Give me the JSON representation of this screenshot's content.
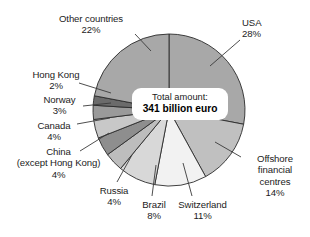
{
  "chart_data": {
    "type": "pie",
    "title": "",
    "subtitle": "",
    "xlabel": "",
    "ylabel": "",
    "legend_position": "none",
    "grid": false,
    "units": "percent",
    "total_label_top": "Total amount:",
    "total_label_bottom": "341 billion euro",
    "total_value": 341,
    "total_units": "billion euro",
    "start_angle_deg": 0,
    "direction": "clockwise",
    "categories": [
      "USA",
      "Offshore financial centres",
      "Switzerland",
      "Brazil",
      "Russia",
      "China (except Hong Kong)",
      "Canada",
      "Norway",
      "Hong Kong",
      "Other countries"
    ],
    "values": [
      28,
      14,
      11,
      8,
      4,
      4,
      4,
      3,
      2,
      22
    ],
    "slices": [
      {
        "name": "USA",
        "value": 28,
        "label": "USA",
        "pct": "28%",
        "color": "#a8a8a8"
      },
      {
        "name": "Offshore financial centres",
        "value": 14,
        "label": "Offshore financial centres",
        "pct": "14%",
        "color": "#c0c0c0"
      },
      {
        "name": "Switzerland",
        "value": 11,
        "label": "Switzerland",
        "pct": "11%",
        "color": "#f2f2f2"
      },
      {
        "name": "Brazil",
        "value": 8,
        "label": "Brazil",
        "pct": "8%",
        "color": "#d8d8d8"
      },
      {
        "name": "Russia",
        "value": 4,
        "label": "Russia",
        "pct": "4%",
        "color": "#bdbdbd"
      },
      {
        "name": "China (except Hong Kong)",
        "value": 4,
        "label": "China",
        "pct": "4%",
        "color": "#8e8e8e"
      },
      {
        "name": "Canada",
        "value": 4,
        "label": "Canada",
        "pct": "4%",
        "color": "#c8c8c8"
      },
      {
        "name": "Norway",
        "value": 3,
        "label": "Norway",
        "pct": "3%",
        "color": "#9a9a9a"
      },
      {
        "name": "Hong Kong",
        "value": 2,
        "label": "Hong Kong",
        "pct": "2%",
        "color": "#6b6b6b"
      },
      {
        "name": "Other countries",
        "value": 22,
        "label": "Other countries",
        "pct": "22%",
        "color": "#a8a8a8"
      }
    ]
  },
  "labels": {
    "other_countries": {
      "name": "Other countries",
      "pct": "22%"
    },
    "usa": {
      "name": "USA",
      "pct": "28%"
    },
    "hong_kong": {
      "name": "Hong Kong",
      "pct": "2%"
    },
    "norway": {
      "name": "Norway",
      "pct": "3%"
    },
    "canada": {
      "name": "Canada",
      "pct": "4%"
    },
    "china": {
      "name": "China",
      "name2": "(except Hong Kong)",
      "pct": "4%"
    },
    "russia": {
      "name": "Russia",
      "pct": "4%"
    },
    "brazil": {
      "name": "Brazil",
      "pct": "8%"
    },
    "switzerland": {
      "name": "Switzerland",
      "pct": "11%"
    },
    "offshore": {
      "name": "Offshore",
      "name2": "financial",
      "name3": "centres",
      "pct": "14%"
    }
  },
  "center": {
    "line1": "Total amount:",
    "line2": "341 billion euro"
  },
  "style": {
    "background": "#ffffff",
    "text_color": "#1c1c1c",
    "slice_outline": "#2b2b2b"
  }
}
